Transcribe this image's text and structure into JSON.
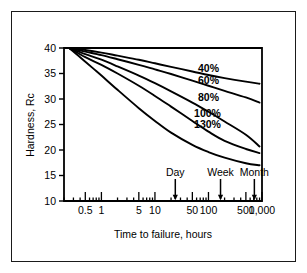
{
  "figure": {
    "background_color": "#ffffff",
    "frame_color": "#1a1a1a",
    "line_color": "#000000"
  },
  "chart_data": {
    "type": "line",
    "title": "",
    "subtitle": "",
    "xlabel": "Time to failure, hours",
    "ylabel": "Hardness, Rc",
    "xscale": "log",
    "yscale": "linear",
    "xlim": [
      0.2,
      1000
    ],
    "ylim": [
      10,
      40
    ],
    "grid": false,
    "legend_position": "inline-curve-labels",
    "yticks": [
      10,
      15,
      20,
      25,
      30,
      35,
      40
    ],
    "ytick_labels": [
      "10",
      "15",
      "20",
      "25",
      "30",
      "35",
      "40"
    ],
    "xticks": [
      0.5,
      1,
      5,
      10,
      50,
      100,
      500,
      1000
    ],
    "xtick_labels": [
      "0.5",
      "1",
      "5",
      "10",
      "50",
      "100",
      "500",
      "1,000"
    ],
    "annotations": [
      {
        "label": "Day",
        "x": 24,
        "y": 10
      },
      {
        "label": "Week",
        "x": 168,
        "y": 10
      },
      {
        "label": "Month",
        "x": 720,
        "y": 10
      }
    ],
    "series": [
      {
        "name": "40%",
        "label": "40%",
        "label_x": 100,
        "label_y": 35.2,
        "points": [
          [
            0.25,
            40.0
          ],
          [
            0.5,
            39.6
          ],
          [
            1,
            39.1
          ],
          [
            2,
            38.5
          ],
          [
            5,
            37.7
          ],
          [
            10,
            37.0
          ],
          [
            20,
            36.3
          ],
          [
            50,
            35.4
          ],
          [
            100,
            34.7
          ],
          [
            200,
            34.1
          ],
          [
            500,
            33.4
          ],
          [
            900,
            33.0
          ]
        ]
      },
      {
        "name": "60%",
        "label": "60%",
        "label_x": 100,
        "label_y": 33.0,
        "points": [
          [
            0.25,
            40.0
          ],
          [
            0.5,
            39.3
          ],
          [
            1,
            38.6
          ],
          [
            2,
            37.8
          ],
          [
            5,
            36.7
          ],
          [
            10,
            35.8
          ],
          [
            20,
            34.9
          ],
          [
            50,
            33.6
          ],
          [
            100,
            32.6
          ],
          [
            200,
            31.6
          ],
          [
            500,
            30.3
          ],
          [
            900,
            29.3
          ]
        ]
      },
      {
        "name": "80%",
        "label": "80%",
        "label_x": 100,
        "label_y": 29.7,
        "points": [
          [
            0.25,
            40.0
          ],
          [
            0.5,
            38.8
          ],
          [
            1,
            37.7
          ],
          [
            2,
            36.4
          ],
          [
            5,
            34.6
          ],
          [
            10,
            33.1
          ],
          [
            20,
            31.5
          ],
          [
            50,
            29.3
          ],
          [
            100,
            27.5
          ],
          [
            200,
            25.6
          ],
          [
            500,
            23.0
          ],
          [
            900,
            20.7
          ]
        ]
      },
      {
        "name": "100%",
        "label": "100%",
        "label_x": 96,
        "label_y": 26.4,
        "points": [
          [
            0.25,
            40.0
          ],
          [
            0.5,
            38.2
          ],
          [
            1,
            36.7
          ],
          [
            2,
            35.0
          ],
          [
            5,
            32.6
          ],
          [
            10,
            30.6
          ],
          [
            20,
            28.5
          ],
          [
            50,
            25.7
          ],
          [
            100,
            23.6
          ],
          [
            200,
            21.8
          ],
          [
            500,
            20.2
          ],
          [
            900,
            19.4
          ]
        ]
      },
      {
        "name": "130%",
        "label": "130%",
        "label_x": 96,
        "label_y": 24.3,
        "points": [
          [
            0.25,
            40.0
          ],
          [
            0.4,
            38.2
          ],
          [
            0.7,
            36.0
          ],
          [
            1,
            34.6
          ],
          [
            2,
            31.8
          ],
          [
            5,
            28.2
          ],
          [
            10,
            25.7
          ],
          [
            20,
            23.4
          ],
          [
            50,
            21.0
          ],
          [
            100,
            19.6
          ],
          [
            200,
            18.5
          ],
          [
            500,
            17.4
          ],
          [
            900,
            17.0
          ]
        ]
      }
    ]
  }
}
